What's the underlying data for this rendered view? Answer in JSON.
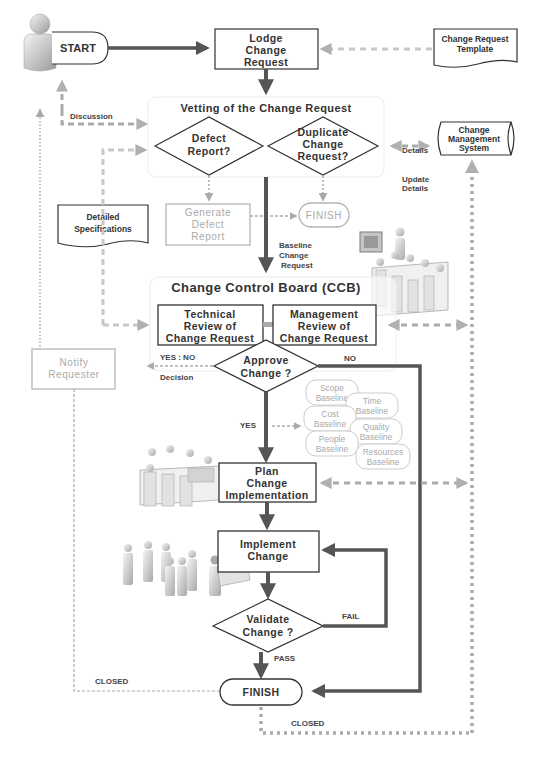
{
  "diagram": {
    "start": {
      "label": "START"
    },
    "lodge": {
      "lines": [
        "Lodge",
        "Change",
        "Request"
      ]
    },
    "template_doc": {
      "lines": [
        "Change Request",
        "Template"
      ]
    },
    "discussion_label": "Discussion",
    "vetting": {
      "title": "Vetting of the Change Request",
      "defect": {
        "lines": [
          "Defect",
          "Report?"
        ]
      },
      "duplicate": {
        "lines": [
          "Duplicate",
          "Change",
          "Request?"
        ]
      }
    },
    "details_label": "Details",
    "cms": {
      "lines": [
        "Change",
        "Management",
        "System"
      ]
    },
    "update_details_label": [
      "Update",
      "Details"
    ],
    "detailed_specs": {
      "lines": [
        "Detailed",
        "Specifications"
      ]
    },
    "generate_defect": {
      "lines": [
        "Generate",
        "Defect",
        "Report"
      ]
    },
    "finish_small": {
      "label": "FINISH"
    },
    "baseline_cr_label": [
      "Baseline",
      "Change",
      "Request"
    ],
    "ccb": {
      "title": "Change Control Board (CCB)",
      "technical": {
        "lines": [
          "Technical",
          "Review of",
          "Change Request"
        ]
      },
      "management": {
        "lines": [
          "Management",
          "Review of",
          "Change Request"
        ]
      },
      "approve": {
        "lines": [
          "Approve",
          "Change ?"
        ]
      },
      "yes_no_label": "YES : NO",
      "decision_label": "Decision",
      "no_label": "NO"
    },
    "notify": {
      "lines": [
        "Notify",
        "Requester"
      ]
    },
    "yes_label": "YES",
    "baselines": [
      {
        "lines": [
          "Scope",
          "Baseline"
        ]
      },
      {
        "lines": [
          "Time",
          "Baseline"
        ]
      },
      {
        "lines": [
          "Cost",
          "Baseline"
        ]
      },
      {
        "lines": [
          "Quality",
          "Baseline"
        ]
      },
      {
        "lines": [
          "People",
          "Baseline"
        ]
      },
      {
        "lines": [
          "Resources",
          "Baseline"
        ]
      }
    ],
    "plan": {
      "lines": [
        "Plan",
        "Change",
        "Implementation"
      ]
    },
    "implement": {
      "lines": [
        "Implement",
        "Change"
      ]
    },
    "validate": {
      "lines": [
        "Validate",
        "Change ?"
      ]
    },
    "fail_label": "FAIL",
    "pass_label": "PASS",
    "closed_left_label": "CLOSED",
    "closed_bottom_label": "CLOSED",
    "finish": {
      "label": "FINISH"
    },
    "colors": {
      "main_arrow": "#555555",
      "box_stroke": "#333333",
      "dashed": "#aaaaaa",
      "gray_text": "#aaaaaa",
      "panel_stroke": "#eeeeee"
    }
  }
}
